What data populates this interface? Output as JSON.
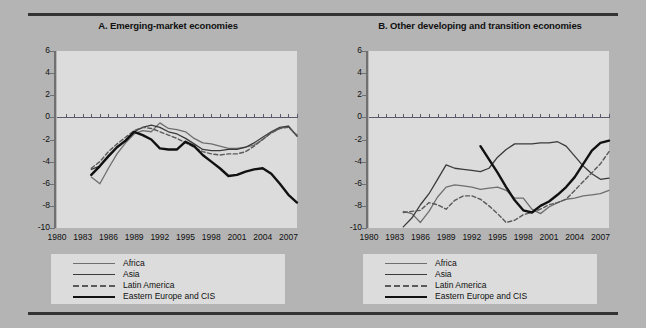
{
  "figure": {
    "background_color": "#b4b4b4",
    "plot_background_color": "#dcdcdc",
    "rule_color": "#333333"
  },
  "series_style": {
    "africa": {
      "color": "#6e6e6e",
      "width": 1.3,
      "dash": "none"
    },
    "asia": {
      "color": "#3a3a3a",
      "width": 1.3,
      "dash": "none"
    },
    "latin": {
      "color": "#5a5a5a",
      "width": 1.4,
      "dash": "4 2.5"
    },
    "eecis": {
      "color": "#111111",
      "width": 2.4,
      "dash": "none"
    }
  },
  "legend": {
    "items": [
      {
        "key": "africa",
        "label": "Africa"
      },
      {
        "key": "asia",
        "label": "Asia"
      },
      {
        "key": "latin",
        "label": "Latin America"
      },
      {
        "key": "eecis",
        "label": "Eastern Europe and CIS"
      }
    ]
  },
  "chart_data": [
    {
      "type": "line",
      "panel": "A",
      "title": "A. Emerging-market economies",
      "xlabel": "",
      "ylabel": "",
      "xlim": [
        1980,
        2008
      ],
      "ylim": [
        -10,
        6
      ],
      "yticks": [
        6,
        4,
        2,
        0,
        -2,
        -4,
        -6,
        -8,
        -10
      ],
      "xticks": [
        1980,
        1983,
        1986,
        1989,
        1992,
        1995,
        1998,
        2001,
        2004,
        2007
      ],
      "grid": false,
      "legend_position": "below",
      "series": [
        {
          "name": "Africa",
          "key": "africa",
          "x": [
            1984,
            1985,
            1986,
            1987,
            1988,
            1989,
            1990,
            1991,
            1992,
            1993,
            1994,
            1995,
            1996,
            1997,
            1998,
            1999,
            2000,
            2001,
            2002,
            2003,
            2004,
            2005,
            2006,
            2007,
            2008
          ],
          "values": [
            -5.4,
            -6.0,
            -4.6,
            -3.3,
            -2.3,
            -1.5,
            -1.2,
            -1.3,
            -0.5,
            -1.0,
            -1.1,
            -1.3,
            -1.9,
            -2.3,
            -2.4,
            -2.6,
            -2.8,
            -2.8,
            -2.7,
            -2.5,
            -2.0,
            -1.4,
            -1.0,
            -0.8,
            -1.7
          ]
        },
        {
          "name": "Asia",
          "key": "asia",
          "x": [
            1984,
            1985,
            1986,
            1987,
            1988,
            1989,
            1990,
            1991,
            1992,
            1993,
            1994,
            1995,
            1996,
            1997,
            1998,
            1999,
            2000,
            2001,
            2002,
            2003,
            2004,
            2005,
            2006,
            2007,
            2008
          ],
          "values": [
            -4.7,
            -4.4,
            -3.6,
            -2.7,
            -2.1,
            -1.3,
            -0.9,
            -0.7,
            -0.9,
            -1.3,
            -1.5,
            -1.9,
            -2.4,
            -2.9,
            -3.0,
            -3.0,
            -2.9,
            -2.9,
            -2.7,
            -2.3,
            -1.8,
            -1.3,
            -0.9,
            -0.8,
            -1.7
          ]
        },
        {
          "name": "Latin America",
          "key": "latin",
          "x": [
            1984,
            1985,
            1986,
            1987,
            1988,
            1989,
            1990,
            1991,
            1992,
            1993,
            1994,
            1995,
            1996,
            1997,
            1998,
            1999,
            2000,
            2001,
            2002,
            2003,
            2004,
            2005,
            2006,
            2007,
            2008
          ],
          "values": [
            -4.6,
            -4.0,
            -3.1,
            -2.4,
            -1.8,
            -1.2,
            -0.9,
            -1.0,
            -1.3,
            -1.6,
            -1.9,
            -2.3,
            -2.7,
            -3.1,
            -3.3,
            -3.4,
            -3.3,
            -3.3,
            -3.1,
            -2.6,
            -2.0,
            -1.4,
            -1.0,
            -0.9,
            -1.6
          ]
        },
        {
          "name": "Eastern Europe and CIS",
          "key": "eecis",
          "x": [
            1984,
            1985,
            1986,
            1987,
            1988,
            1989,
            1990,
            1991,
            1992,
            1993,
            1994,
            1995,
            1996,
            1997,
            1998,
            1999,
            2000,
            2001,
            2002,
            2003,
            2004,
            2005,
            2006,
            2007,
            2008
          ],
          "values": [
            -5.2,
            -4.4,
            -3.5,
            -2.7,
            -2.1,
            -1.3,
            -1.6,
            -2.0,
            -2.8,
            -2.9,
            -2.9,
            -2.2,
            -2.6,
            -3.4,
            -4.0,
            -4.6,
            -5.3,
            -5.2,
            -4.9,
            -4.7,
            -4.6,
            -5.1,
            -6.0,
            -7.0,
            -7.7
          ]
        }
      ]
    },
    {
      "type": "line",
      "panel": "B",
      "title": "B. Other developing and transition economies",
      "xlabel": "",
      "ylabel": "",
      "xlim": [
        1980,
        2008
      ],
      "ylim": [
        -10,
        6
      ],
      "yticks": [
        6,
        4,
        2,
        0,
        -2,
        -4,
        -6,
        -8,
        -10
      ],
      "xticks": [
        1980,
        1983,
        1986,
        1989,
        1992,
        1995,
        1998,
        2001,
        2004,
        2007
      ],
      "grid": false,
      "legend_position": "below",
      "series": [
        {
          "name": "Africa",
          "key": "africa",
          "x": [
            1984,
            1985,
            1986,
            1987,
            1988,
            1989,
            1990,
            1991,
            1992,
            1993,
            1994,
            1995,
            1996,
            1997,
            1998,
            1999,
            2000,
            2001,
            2002,
            2003,
            2004,
            2005,
            2006,
            2007,
            2008
          ],
          "values": [
            -8.5,
            -8.7,
            -9.5,
            -8.5,
            -7.2,
            -6.3,
            -6.1,
            -6.2,
            -6.3,
            -6.5,
            -6.4,
            -6.3,
            -6.6,
            -7.3,
            -7.3,
            -8.3,
            -8.7,
            -8.1,
            -7.7,
            -7.4,
            -7.3,
            -7.1,
            -7.0,
            -6.9,
            -6.6
          ]
        },
        {
          "name": "Asia",
          "key": "asia",
          "x": [
            1984,
            1985,
            1986,
            1987,
            1988,
            1989,
            1990,
            1991,
            1992,
            1993,
            1994,
            1995,
            1996,
            1997,
            1998,
            1999,
            2000,
            2001,
            2002,
            2003,
            2004,
            2005,
            2006,
            2007,
            2008
          ],
          "values": [
            -9.9,
            -9.1,
            -7.9,
            -6.9,
            -5.6,
            -4.3,
            -4.6,
            -4.7,
            -4.8,
            -4.9,
            -4.6,
            -3.6,
            -2.9,
            -2.4,
            -2.4,
            -2.4,
            -2.3,
            -2.3,
            -2.2,
            -2.6,
            -3.5,
            -4.4,
            -5.1,
            -5.6,
            -5.5
          ]
        },
        {
          "name": "Latin America",
          "key": "latin",
          "x": [
            1984,
            1985,
            1986,
            1987,
            1988,
            1989,
            1990,
            1991,
            1992,
            1993,
            1994,
            1995,
            1996,
            1997,
            1998,
            1999,
            2000,
            2001,
            2002,
            2003,
            2004,
            2005,
            2006,
            2007,
            2008
          ],
          "values": [
            -8.6,
            -8.5,
            -8.4,
            -7.7,
            -7.9,
            -8.3,
            -7.5,
            -7.1,
            -7.1,
            -7.4,
            -8.0,
            -8.7,
            -9.5,
            -9.3,
            -8.8,
            -8.6,
            -8.3,
            -7.9,
            -7.7,
            -7.4,
            -6.6,
            -5.8,
            -5.0,
            -4.2,
            -3.1
          ]
        },
        {
          "name": "Eastern Europe and CIS",
          "key": "eecis",
          "x": [
            1993,
            1994,
            1995,
            1996,
            1997,
            1998,
            1999,
            2000,
            2001,
            2002,
            2003,
            2004,
            2005,
            2006,
            2007,
            2008
          ],
          "values": [
            -2.6,
            -3.8,
            -5.0,
            -6.3,
            -7.5,
            -8.4,
            -8.6,
            -8.0,
            -7.6,
            -7.0,
            -6.3,
            -5.4,
            -4.2,
            -3.0,
            -2.3,
            -2.1
          ]
        }
      ]
    }
  ]
}
